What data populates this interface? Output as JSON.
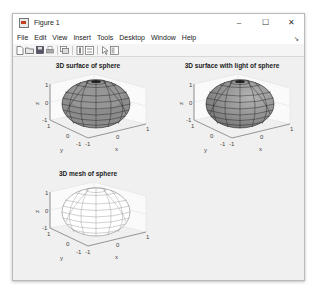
{
  "window": {
    "title": "Figure 1",
    "controls": {
      "minimize": "–",
      "maximize": "☐",
      "close": "✕"
    }
  },
  "menubar": {
    "items": [
      "File",
      "Edit",
      "View",
      "Insert",
      "Tools",
      "Desktop",
      "Window",
      "Help"
    ],
    "overflow_arrow": "➘"
  },
  "toolbar": {
    "buttons": [
      {
        "name": "new-figure-icon"
      },
      {
        "name": "open-file-icon"
      },
      {
        "name": "save-icon"
      },
      {
        "name": "print-icon"
      },
      {
        "name": "link-plot-icon"
      },
      {
        "name": "insert-colorbar-icon"
      },
      {
        "name": "insert-legend-icon"
      },
      {
        "name": "edit-plot-arrow-icon"
      },
      {
        "name": "property-inspector-icon"
      }
    ]
  },
  "colors": {
    "surface_fill": "#8c8c8c",
    "surface_light": "#a9a9a9",
    "mesh_line": "#9a9a9a",
    "axes_line": "#555555",
    "panel_bg": "#f0f0f0"
  },
  "subplots": [
    {
      "title": "3D surface of sphere",
      "xlabel": "x",
      "ylabel": "y",
      "zlabel": "z",
      "xticks": [
        "-1",
        "0",
        "1"
      ],
      "yticks": [
        "-1",
        "0",
        "1"
      ],
      "zticks": [
        "-1",
        "0",
        "1"
      ],
      "style": "surface"
    },
    {
      "title": "3D surface with light of sphere",
      "xlabel": "x",
      "ylabel": "y",
      "zlabel": "z",
      "xticks": [
        "-1",
        "0",
        "1"
      ],
      "yticks": [
        "-1",
        "0",
        "1"
      ],
      "zticks": [
        "-1",
        "0",
        "1"
      ],
      "style": "lit-surface"
    },
    {
      "title": "3D mesh of sphere",
      "xlabel": "x",
      "ylabel": "y",
      "zlabel": "z",
      "xticks": [
        "-1",
        "0",
        "1"
      ],
      "yticks": [
        "-1",
        "0",
        "1"
      ],
      "zticks": [
        "-1",
        "0",
        "1"
      ],
      "style": "mesh"
    }
  ]
}
